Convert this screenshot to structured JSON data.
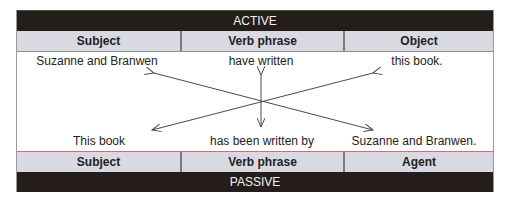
{
  "active": {
    "title": "ACTIVE",
    "headers": [
      "Subject",
      "Verb phrase",
      "Object"
    ],
    "words": [
      "Suzanne and Branwen",
      "have written",
      "this book."
    ]
  },
  "passive": {
    "title": "PASSIVE",
    "headers": [
      "Subject",
      "Verb phrase",
      "Agent"
    ],
    "words": [
      "This book",
      "has been written by",
      "Suzanne and Branwen."
    ]
  },
  "arrows": [
    {
      "name": "subject-to-agent",
      "from": "Suzanne and Branwen",
      "to": "Suzanne and Branwen."
    },
    {
      "name": "object-to-subject",
      "from": "this book.",
      "to": "This book"
    },
    {
      "name": "verb-transform",
      "from": "have written",
      "to": "has been written by"
    }
  ],
  "colors": {
    "bar": "#241d1c",
    "header": "#d9dae1",
    "divider_passive": "#d46a7a",
    "arrow": "#4a4a4a"
  }
}
